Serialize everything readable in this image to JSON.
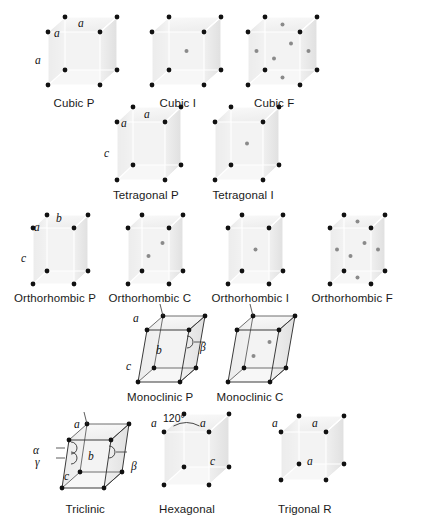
{
  "figure": {
    "title_present": false,
    "background_color": "#ffffff",
    "vertex_color": "#111111",
    "interior_point_color": "#8a8a8a",
    "edge_light_color": "#ffffff",
    "edge_dark_color": "#4a4a4a",
    "face_fill_top": "#f2f2f2",
    "face_fill_left": "#e3e3e3",
    "face_fill_right": "#ececec"
  },
  "rows": [
    {
      "name": "cubic-row",
      "cells": [
        {
          "id": "cubic-p",
          "caption": "Cubic P",
          "lattice_type": "P",
          "shape": "cube",
          "origin": [
            48,
            32
          ],
          "width": 52,
          "height": 53,
          "depth": [
            17,
            -15
          ],
          "shear": 0,
          "caption_center": [
            74,
            97
          ],
          "outline": "light",
          "interior_points": [],
          "axis_labels": [
            {
              "text": "a",
              "pos": [
                54,
                27
              ],
              "name": "edge-label-a-top-left"
            },
            {
              "text": "a",
              "pos": [
                78,
                17
              ],
              "name": "edge-label-a-top-back"
            },
            {
              "text": "a",
              "pos": [
                35,
                54
              ],
              "name": "edge-label-a-vertical"
            }
          ],
          "angle_labels": []
        },
        {
          "id": "cubic-i",
          "caption": "Cubic I",
          "lattice_type": "I",
          "shape": "cube",
          "origin": [
            152,
            32
          ],
          "width": 52,
          "height": 53,
          "depth": [
            17,
            -15
          ],
          "shear": 0,
          "caption_center": [
            178,
            97
          ],
          "outline": "light",
          "interior_points": [
            [
              0.5,
              0.5,
              0.5
            ]
          ],
          "axis_labels": [],
          "angle_labels": []
        },
        {
          "id": "cubic-f",
          "caption": "Cubic F",
          "lattice_type": "F",
          "shape": "cube",
          "origin": [
            248,
            32
          ],
          "width": 52,
          "height": 53,
          "depth": [
            17,
            -15
          ],
          "shear": 0,
          "caption_center": [
            274,
            97
          ],
          "outline": "light",
          "interior_points": [
            [
              0.5,
              0.5,
              0
            ],
            [
              0.5,
              0.5,
              1
            ],
            [
              0.5,
              0,
              0.5
            ],
            [
              0.5,
              1,
              0.5
            ],
            [
              0,
              0.5,
              0.5
            ],
            [
              1,
              0.5,
              0.5
            ]
          ],
          "axis_labels": [],
          "angle_labels": []
        }
      ]
    },
    {
      "name": "tetragonal-row",
      "cells": [
        {
          "id": "tetragonal-p",
          "caption": "Tetragonal P",
          "lattice_type": "P",
          "shape": "cube",
          "origin": [
            117,
            122
          ],
          "width": 48,
          "height": 58,
          "depth": [
            16,
            -15
          ],
          "shear": 0,
          "caption_center": [
            146,
            189
          ],
          "outline": "light",
          "interior_points": [],
          "axis_labels": [
            {
              "text": "a",
              "pos": [
                121,
                117
              ],
              "name": "edge-label-a-top-left"
            },
            {
              "text": "a",
              "pos": [
                144,
                108
              ],
              "name": "edge-label-a-top-back"
            },
            {
              "text": "c",
              "pos": [
                104,
                147
              ],
              "name": "edge-label-c-vertical"
            }
          ],
          "angle_labels": []
        },
        {
          "id": "tetragonal-i",
          "caption": "Tetragonal I",
          "lattice_type": "I",
          "shape": "cube",
          "origin": [
            215,
            122
          ],
          "width": 48,
          "height": 58,
          "depth": [
            16,
            -15
          ],
          "shear": 0,
          "caption_center": [
            243,
            189
          ],
          "outline": "light",
          "interior_points": [
            [
              0.5,
              0.5,
              0.5
            ]
          ],
          "axis_labels": [],
          "angle_labels": []
        }
      ]
    },
    {
      "name": "orthorhombic-row",
      "cells": [
        {
          "id": "orthorhombic-p",
          "caption": "Orthorhombic P",
          "lattice_type": "P",
          "shape": "cube",
          "origin": [
            33,
            228
          ],
          "width": 41,
          "height": 56,
          "depth": [
            14,
            -13
          ],
          "shear": 0,
          "caption_center": [
            55,
            292
          ],
          "outline": "light",
          "interior_points": [],
          "axis_labels": [
            {
              "text": "a",
              "pos": [
                34,
                221
              ],
              "name": "edge-label-a-top-left"
            },
            {
              "text": "b",
              "pos": [
                56,
                212
              ],
              "name": "edge-label-b-top-back"
            },
            {
              "text": "c",
              "pos": [
                21,
                252
              ],
              "name": "edge-label-c-vertical"
            }
          ],
          "angle_labels": []
        },
        {
          "id": "orthorhombic-c",
          "caption": "Orthorhombic C",
          "lattice_type": "C",
          "shape": "cube",
          "origin": [
            128,
            228
          ],
          "width": 41,
          "height": 56,
          "depth": [
            14,
            -13
          ],
          "shear": 0,
          "caption_center": [
            150,
            292
          ],
          "outline": "light",
          "interior_points": [
            [
              0.5,
              0.5,
              0
            ],
            [
              0.5,
              0.5,
              1
            ]
          ],
          "axis_labels": [],
          "angle_labels": []
        },
        {
          "id": "orthorhombic-i",
          "caption": "Orthorhombic I",
          "lattice_type": "I",
          "shape": "cube",
          "origin": [
            228,
            228
          ],
          "width": 41,
          "height": 56,
          "depth": [
            14,
            -13
          ],
          "shear": 0,
          "caption_center": [
            250,
            292
          ],
          "outline": "light",
          "interior_points": [
            [
              0.5,
              0.5,
              0.5
            ]
          ],
          "axis_labels": [],
          "angle_labels": []
        },
        {
          "id": "orthorhombic-f",
          "caption": "Orthorhombic F",
          "lattice_type": "F",
          "shape": "cube",
          "origin": [
            330,
            228
          ],
          "width": 41,
          "height": 56,
          "depth": [
            14,
            -13
          ],
          "shear": 0,
          "caption_center": [
            352,
            292
          ],
          "outline": "light",
          "interior_points": [
            [
              0.5,
              0.5,
              0
            ],
            [
              0.5,
              0.5,
              1
            ],
            [
              0.5,
              0,
              0.5
            ],
            [
              0.5,
              1,
              0.5
            ],
            [
              0,
              0.5,
              0.5
            ],
            [
              1,
              0.5,
              0.5
            ]
          ],
          "axis_labels": [],
          "angle_labels": []
        }
      ]
    },
    {
      "name": "monoclinic-row",
      "cells": [
        {
          "id": "monoclinic-p",
          "caption": "Monoclinic P",
          "lattice_type": "P",
          "shape": "monoclinic",
          "origin": [
            138,
            330
          ],
          "width": 42,
          "height": 52,
          "depth": [
            16,
            -14
          ],
          "shear": 9,
          "caption_center": [
            160,
            391
          ],
          "outline": "dark",
          "interior_points": [],
          "axis_labels": [
            {
              "text": "a",
              "pos": [
                133,
                312
              ],
              "name": "edge-label-a-top"
            },
            {
              "text": "b",
              "pos": [
                156,
                344
              ],
              "name": "edge-label-b-front"
            },
            {
              "text": "c",
              "pos": [
                126,
                360
              ],
              "name": "edge-label-c-vertical"
            }
          ],
          "angle_labels": [
            {
              "text": "β",
              "pos": [
                200,
                341
              ],
              "name": "angle-label-beta"
            }
          ]
        },
        {
          "id": "monoclinic-c",
          "caption": "Monoclinic C",
          "lattice_type": "C",
          "shape": "monoclinic",
          "origin": [
            228,
            330
          ],
          "width": 42,
          "height": 52,
          "depth": [
            16,
            -14
          ],
          "shear": 9,
          "caption_center": [
            250,
            391
          ],
          "outline": "dark",
          "interior_points": [
            [
              0.5,
              0.5,
              0
            ],
            [
              0.5,
              0.5,
              1
            ]
          ],
          "axis_labels": [],
          "angle_labels": []
        }
      ]
    },
    {
      "name": "triclinic-row",
      "cells": [
        {
          "id": "triclinic",
          "caption": "Triclinic",
          "lattice_type": "P",
          "shape": "triclinic",
          "origin": [
            62,
            440
          ],
          "width": 42,
          "height": 48,
          "depth": [
            18,
            -16
          ],
          "shear": 7,
          "caption_center": [
            85,
            503
          ],
          "outline": "dark",
          "interior_points": [],
          "axis_labels": [
            {
              "text": "a",
              "pos": [
                74,
                418
              ],
              "name": "edge-label-a-top"
            },
            {
              "text": "b",
              "pos": [
                88,
                450
              ],
              "name": "edge-label-b-front"
            },
            {
              "text": "c",
              "pos": [
                64,
                470
              ],
              "name": "edge-label-c-vertical"
            }
          ],
          "angle_labels": [
            {
              "text": "α",
              "pos": [
                33,
                444
              ],
              "name": "angle-label-alpha"
            },
            {
              "text": "γ",
              "pos": [
                35,
                456
              ],
              "name": "angle-label-gamma"
            },
            {
              "text": "β",
              "pos": [
                131,
                460
              ],
              "name": "angle-label-beta"
            }
          ]
        },
        {
          "id": "hexagonal",
          "caption": "Hexagonal",
          "lattice_type": "P",
          "shape": "hexagonal",
          "origin": [
            164,
            432
          ],
          "width": 45,
          "height": 53,
          "depth": [
            20,
            -18
          ],
          "shear": 0,
          "caption_center": [
            187,
            503
          ],
          "outline": "light",
          "interior_points": [],
          "axis_labels": [
            {
              "text": "a",
              "pos": [
                151,
                417
              ],
              "name": "edge-label-a-left"
            },
            {
              "text": "a",
              "pos": [
                200,
                417
              ],
              "name": "edge-label-a-right"
            },
            {
              "text": "c",
              "pos": [
                210,
                455
              ],
              "name": "edge-label-c-vertical"
            }
          ],
          "angle_labels": [],
          "degree_labels": [
            {
              "text": "120°",
              "pos": [
                163,
                412
              ],
              "name": "angle-label-120"
            }
          ]
        },
        {
          "id": "trigonal-r",
          "caption": "Trigonal R",
          "lattice_type": "P",
          "shape": "cube",
          "origin": [
            281,
            432
          ],
          "width": 45,
          "height": 48,
          "depth": [
            18,
            -16
          ],
          "shear": 0,
          "caption_center": [
            305,
            503
          ],
          "outline": "light",
          "interior_points": [],
          "axis_labels": [
            {
              "text": "a",
              "pos": [
                272,
                417
              ],
              "name": "edge-label-a-left"
            },
            {
              "text": "a",
              "pos": [
                312,
                417
              ],
              "name": "edge-label-a-right"
            },
            {
              "text": "a",
              "pos": [
                307,
                455
              ],
              "name": "edge-label-a-face"
            }
          ],
          "angle_labels": []
        }
      ]
    }
  ],
  "captions": {
    "cubic_p": "Cubic P",
    "cubic_i": "Cubic I",
    "cubic_f": "Cubic F",
    "tetragonal_p": "Tetragonal P",
    "tetragonal_i": "Tetragonal I",
    "orthorhombic_p": "Orthorhombic P",
    "orthorhombic_c": "Orthorhombic C",
    "orthorhombic_i": "Orthorhombic I",
    "orthorhombic_f": "Orthorhombic F",
    "monoclinic_p": "Monoclinic P",
    "monoclinic_c": "Monoclinic C",
    "triclinic": "Triclinic",
    "hexagonal": "Hexagonal",
    "trigonal_r": "Trigonal R"
  }
}
